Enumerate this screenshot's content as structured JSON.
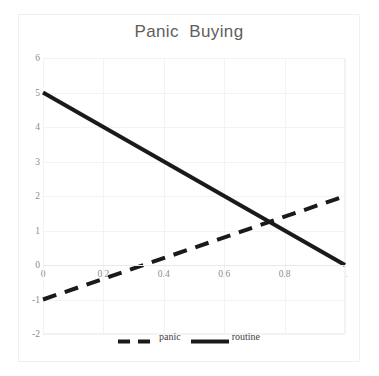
{
  "chart_data": {
    "type": "line",
    "title": "Panic  Buying",
    "xlabel": "",
    "ylabel": "",
    "xlim": [
      0,
      1
    ],
    "ylim": [
      -2,
      6
    ],
    "grid": true,
    "legend_position": "bottom-center",
    "x_ticks": [
      "0",
      "0.2",
      "0.4",
      "0.6",
      "0.8",
      "1"
    ],
    "x_tick_values": [
      0,
      0.2,
      0.4,
      0.6,
      0.8,
      1
    ],
    "y_ticks": [
      "6",
      "5",
      "4",
      "3",
      "2",
      "1",
      "0",
      "-1",
      "-2"
    ],
    "y_tick_values": [
      6,
      5,
      4,
      3,
      2,
      1,
      0,
      -1,
      -2
    ],
    "x": [
      0,
      1
    ],
    "series": [
      {
        "name": "panic",
        "values": [
          -1,
          2
        ],
        "style": "dashed",
        "color": "#1a1a1a",
        "width": 4
      },
      {
        "name": "routine",
        "values": [
          5,
          0
        ],
        "style": "solid",
        "color": "#1a1a1a",
        "width": 4
      }
    ],
    "intersection": {
      "x": 0.75,
      "y": 1.25
    }
  },
  "legend": {
    "items": [
      {
        "label": "panic",
        "style": "dashed"
      },
      {
        "label": "routine",
        "style": "solid"
      }
    ]
  },
  "colors": {
    "series_line": "#1a1a1a",
    "gridline": "#f3f3f4",
    "axis_spine": "#c9c9cc",
    "tick_text": "#8c8c8c",
    "title_text": "#5e5e5e",
    "frame": "#f0f0f2",
    "background": "#ffffff"
  }
}
